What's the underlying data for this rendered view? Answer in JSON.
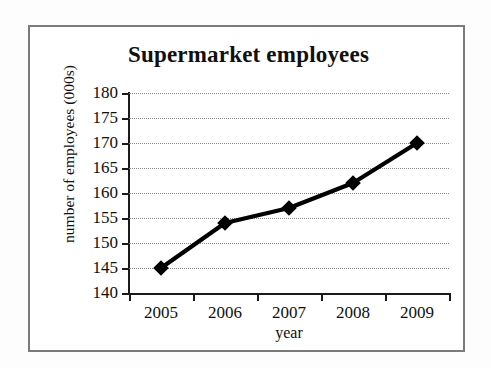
{
  "chart_data": {
    "type": "line",
    "title": "Supermarket employees",
    "xlabel": "year",
    "ylabel": "number of employees (000s)",
    "categories": [
      "2005",
      "2006",
      "2007",
      "2008",
      "2009"
    ],
    "values": [
      145,
      154,
      157,
      162,
      170
    ],
    "series": [
      {
        "name": "number of employees",
        "values": [
          145,
          154,
          157,
          162,
          170
        ]
      }
    ],
    "ylim": [
      140,
      180
    ],
    "ytick_step": 5,
    "ytick_labels": [
      "180",
      "175",
      "170",
      "165",
      "160",
      "155",
      "150",
      "145",
      "140"
    ],
    "ytick_values": [
      180,
      175,
      170,
      165,
      160,
      155,
      150,
      145,
      140
    ],
    "gridlines": "horizontal-dotted",
    "grid": true,
    "legend": "none",
    "marker": "diamond",
    "line_color": "#000000",
    "marker_color": "#000000",
    "grid_color": "#8a8a8a",
    "axis_color": "#1a1a1a",
    "frame_color": "#7b7b7b",
    "background": "#ffffff"
  }
}
